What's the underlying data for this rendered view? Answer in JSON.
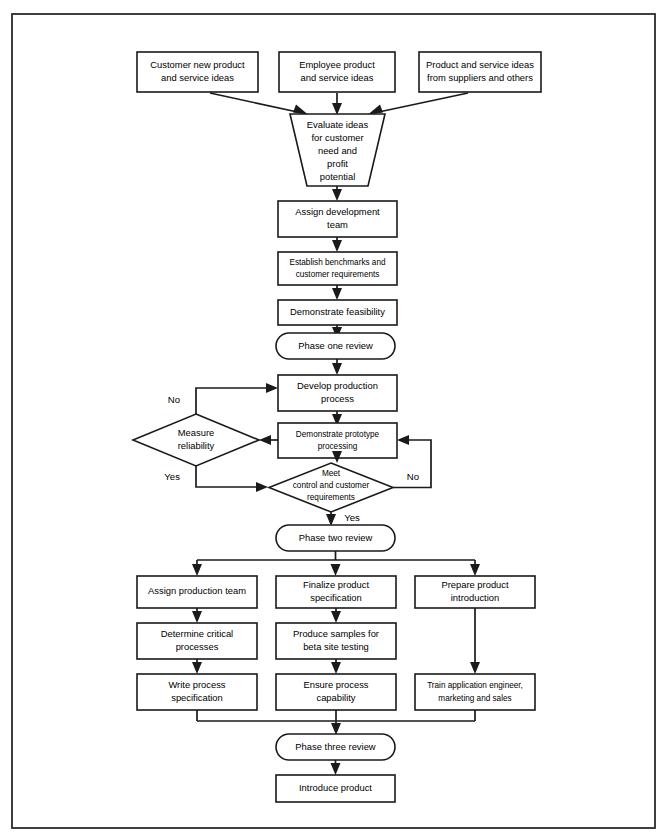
{
  "diagram": {
    "colors": {
      "stroke": "#1a1a1a",
      "fill": "#ffffff",
      "frame": "#2b2b2b"
    },
    "inputs": [
      {
        "id": "customer-ideas",
        "line1": "Customer new product",
        "line2": "and service ideas"
      },
      {
        "id": "employee-ideas",
        "line1": "Employee product",
        "line2": "and service ideas"
      },
      {
        "id": "supplier-ideas",
        "line1": "Product and service ideas",
        "line2": "from suppliers and others"
      }
    ],
    "evaluate": {
      "id": "evaluate-ideas",
      "line1": "Evaluate ideas",
      "line2": "for customer",
      "line3": "need and",
      "line4": "profit",
      "line5": "potential"
    },
    "phase_one": [
      {
        "id": "assign-development-team",
        "line1": "Assign development",
        "line2": "team"
      },
      {
        "id": "establish-benchmarks",
        "line1": "Establish benchmarks and",
        "line2": "customer requirements"
      },
      {
        "id": "demonstrate-feasibility",
        "line1": "Demonstrate feasibility",
        "line2": ""
      }
    ],
    "phase_one_review": {
      "id": "phase-one-review",
      "label": "Phase one review"
    },
    "phase_two": {
      "develop_production": {
        "id": "develop-production-process",
        "line1": "Develop production",
        "line2": "process"
      },
      "demonstrate_prototype": {
        "id": "demonstrate-prototype-processing",
        "line1": "Demonstrate prototype",
        "line2": "processing"
      },
      "measure_reliability": {
        "id": "measure-reliability",
        "line1": "Measure",
        "line2": "reliability"
      },
      "meet_requirements": {
        "id": "meet-control-customer-requirements",
        "line1": "Meet",
        "line2": "control and customer",
        "line3": "requirements"
      }
    },
    "branch_labels": {
      "measure_no": "No",
      "measure_yes": "Yes",
      "meet_no": "No",
      "meet_yes": "Yes"
    },
    "phase_two_review": {
      "id": "phase-two-review",
      "label": "Phase two review"
    },
    "column_left": [
      {
        "id": "assign-production-team",
        "line1": "Assign production team",
        "line2": ""
      },
      {
        "id": "determine-critical-processes",
        "line1": "Determine critical",
        "line2": "processes"
      },
      {
        "id": "write-process-specification",
        "line1": "Write process",
        "line2": "specification"
      }
    ],
    "column_center": [
      {
        "id": "finalize-product-specification",
        "line1": "Finalize product",
        "line2": "specification"
      },
      {
        "id": "produce-beta-samples",
        "line1": "Produce samples for",
        "line2": "beta site testing"
      },
      {
        "id": "ensure-process-capability",
        "line1": "Ensure process",
        "line2": "capability"
      }
    ],
    "column_right": [
      {
        "id": "prepare-product-introduction",
        "line1": "Prepare product",
        "line2": "introduction"
      },
      {
        "id": "train-application-engineer",
        "line1": "Train application engineer,",
        "line2": "marketing and sales"
      }
    ],
    "phase_three_review": {
      "id": "phase-three-review",
      "label": "Phase three review"
    },
    "introduce_product": {
      "id": "introduce-product",
      "label": "Introduce product"
    }
  }
}
